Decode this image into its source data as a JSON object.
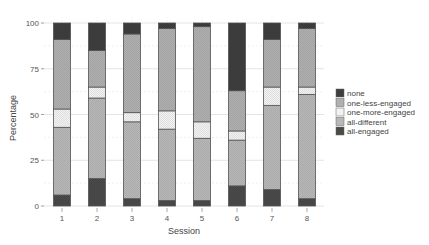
{
  "chart_data": {
    "type": "bar",
    "stacked": true,
    "title": "",
    "xlabel": "Session",
    "ylabel": "Percentage",
    "ylim": [
      0,
      100
    ],
    "yticks": [
      0,
      25,
      50,
      75,
      100
    ],
    "grid": true,
    "legend_position": "right",
    "categories": [
      "1",
      "2",
      "3",
      "4",
      "5",
      "6",
      "7",
      "8"
    ],
    "series": [
      {
        "name": "all-engaged",
        "color": "#4a4a4a",
        "values": [
          6,
          15,
          4,
          3,
          3,
          11,
          9,
          4
        ]
      },
      {
        "name": "all-different",
        "color": "#b8b8b8",
        "values": [
          37,
          44,
          42,
          39,
          34,
          25,
          46,
          57
        ]
      },
      {
        "name": "one-more-engaged",
        "color": "#f2f2f2",
        "values": [
          10,
          6,
          5,
          10,
          9,
          5,
          10,
          4
        ]
      },
      {
        "name": "one-less-engaged",
        "color": "#b0b0b0",
        "values": [
          38,
          20,
          43,
          45,
          52,
          22,
          26,
          32
        ]
      },
      {
        "name": "none",
        "color": "#3e3e3e",
        "values": [
          9,
          15,
          6,
          3,
          2,
          37,
          9,
          3
        ]
      }
    ],
    "legend": [
      "none",
      "one-less-engaged",
      "one-more-engaged",
      "all-different",
      "all-engaged"
    ]
  }
}
